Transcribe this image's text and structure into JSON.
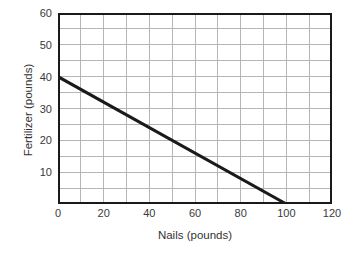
{
  "chart_data": {
    "type": "line",
    "title": "",
    "xlabel": "Nails (pounds)",
    "ylabel": "Fertilizer (pounds)",
    "xlim": [
      0,
      120
    ],
    "ylim": [
      0,
      60
    ],
    "xticks": [
      0,
      20,
      40,
      60,
      80,
      100,
      120
    ],
    "xtick_labels": [
      "0",
      "20",
      "40",
      "60",
      "80",
      "100",
      "120"
    ],
    "yticks": [
      10,
      20,
      30,
      40,
      50,
      60
    ],
    "ytick_labels": [
      "10",
      "20",
      "30",
      "40",
      "50",
      "60"
    ],
    "grid": true,
    "grid_x_step": 10,
    "grid_y_step": 5,
    "grid_color": "#b5b5b5",
    "axis_color": "#1a1a1a",
    "legend": null,
    "series": [
      {
        "name": "budget line",
        "color": "#1a1a1a",
        "line_width": 3,
        "x": [
          0,
          100
        ],
        "y": [
          40,
          0
        ],
        "points": [
          {
            "x": 0,
            "y": 40
          },
          {
            "x": 20,
            "y": 32
          },
          {
            "x": 40,
            "y": 24
          },
          {
            "x": 60,
            "y": 16
          },
          {
            "x": 80,
            "y": 8
          },
          {
            "x": 100,
            "y": 0
          }
        ],
        "slope": -0.4,
        "intercept": 40
      }
    ]
  }
}
